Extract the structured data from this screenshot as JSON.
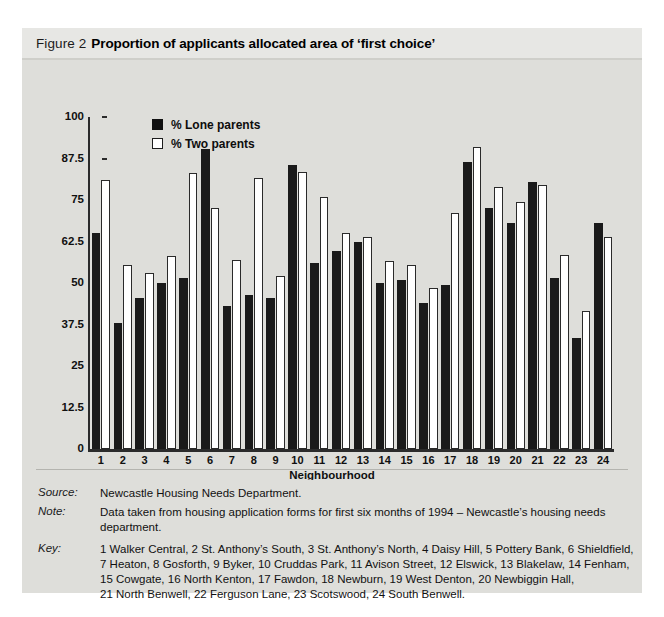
{
  "figure": {
    "number_label": "Figure 2",
    "title": "Proportion of applicants allocated area of ‘first choice’"
  },
  "legend": {
    "series": [
      {
        "key": "lone",
        "label": "% Lone parents",
        "color": "#1a1a1a",
        "swatch": "filled-square"
      },
      {
        "key": "two",
        "label": "% Two parents",
        "color": "#ffffff",
        "swatch": "open-square"
      }
    ]
  },
  "notes": [
    {
      "label": "Source:",
      "text": "Newcastle Housing Needs Department."
    },
    {
      "label": "Note:",
      "text": "Data taken from housing application forms for first six months of 1994 – Newcastle’s housing needs department."
    }
  ],
  "key": {
    "label": "Key:",
    "lines": [
      "1 Walker Central, 2 St. Anthony’s South, 3 St. Anthony’s North, 4 Daisy Hill, 5 Pottery Bank, 6 Shieldfield,",
      "7 Heaton, 8 Gosforth, 9 Byker, 10 Cruddas Park, 11 Avison Street, 12 Elswick, 13 Blakelaw, 14 Fenham,",
      "15 Cowgate, 16 North Kenton, 17 Fawdon, 18 Newburn, 19 West Denton, 20 Newbiggin Hall,",
      "21 North Benwell, 22 Ferguson Lane, 23 Scotswood, 24 South Benwell."
    ]
  },
  "chart_data": {
    "type": "bar",
    "title": "Proportion of applicants allocated area of ‘first choice’",
    "xlabel": "Neighbourhood",
    "ylabel": "",
    "ylim": [
      0,
      100
    ],
    "yticks": [
      0,
      12.5,
      25,
      37.5,
      50,
      62.5,
      75,
      87.5,
      100
    ],
    "ytick_labels": [
      "0",
      "12.5",
      "25",
      "37.5",
      "50",
      "62.5",
      "75",
      "87.5",
      "100"
    ],
    "grid": false,
    "legend_position": "top-left-inside",
    "categories": [
      "1",
      "2",
      "3",
      "4",
      "5",
      "6",
      "7",
      "8",
      "9",
      "10",
      "11",
      "12",
      "13",
      "14",
      "15",
      "16",
      "17",
      "18",
      "19",
      "20",
      "21",
      "22",
      "23",
      "24"
    ],
    "category_names": [
      "Walker Central",
      "St. Anthony’s South",
      "St. Anthony’s North",
      "Daisy Hill",
      "Pottery Bank",
      "Shieldfield",
      "Heaton",
      "Gosforth",
      "Byker",
      "Cruddas Park",
      "Avison Street",
      "Elswick",
      "Blakelaw",
      "Fenham",
      "Cowgate",
      "North Kenton",
      "Fawdon",
      "Newburn",
      "West Denton",
      "Newbiggin Hall",
      "North Benwell",
      "Ferguson Lane",
      "Scotswood",
      "South Benwell"
    ],
    "series": [
      {
        "name": "% Lone parents",
        "color": "#1a1a1a",
        "values": [
          65,
          38,
          45.5,
          50,
          51.5,
          90.5,
          43,
          46.5,
          45.5,
          85.5,
          56,
          59.5,
          62.5,
          50,
          51,
          44,
          49.5,
          86.5,
          72.5,
          68,
          80.5,
          51.5,
          33.5,
          68
        ]
      },
      {
        "name": "% Two parents",
        "color": "#ffffff",
        "values": [
          81,
          55.5,
          53,
          58,
          83,
          72.5,
          57,
          81.5,
          52,
          83.5,
          76,
          65,
          64,
          56.5,
          55.5,
          48.5,
          71,
          91,
          79,
          74.5,
          79.5,
          58.5,
          41.5,
          64
        ]
      }
    ]
  }
}
